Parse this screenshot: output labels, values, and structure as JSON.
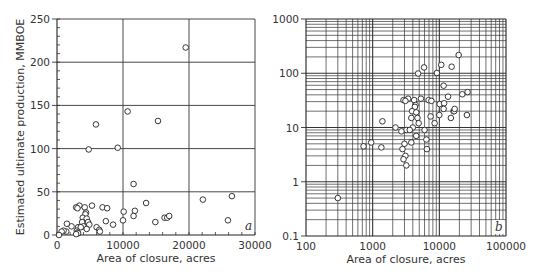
{
  "chart_data": [
    {
      "type": "scatter",
      "panel": "a",
      "xlabel": "Area of closure, acres",
      "ylabel": "Estimated ultimate production, MMBOE",
      "xlim": [
        0,
        30000
      ],
      "ylim": [
        0,
        250
      ],
      "x_ticks": [
        0,
        10000,
        20000,
        30000
      ],
      "y_ticks": [
        0,
        50,
        100,
        150,
        200,
        250
      ],
      "x_tick_labels": [
        "0",
        "10000",
        "20000",
        "30000"
      ],
      "y_tick_labels": [
        "0",
        "50",
        "100",
        "150",
        "200",
        "250"
      ],
      "grid": true,
      "marker": "open-circle",
      "points": [
        [
          19500,
          217
        ],
        [
          10700,
          143
        ],
        [
          15300,
          132
        ],
        [
          5900,
          128
        ],
        [
          4800,
          99
        ],
        [
          9200,
          101
        ],
        [
          11600,
          59
        ],
        [
          22100,
          41
        ],
        [
          26500,
          45
        ],
        [
          25900,
          17
        ],
        [
          13500,
          37
        ],
        [
          10100,
          27
        ],
        [
          10000,
          17
        ],
        [
          11800,
          28
        ],
        [
          11600,
          22
        ],
        [
          14900,
          15
        ],
        [
          16300,
          20
        ],
        [
          16700,
          20
        ],
        [
          17000,
          22
        ],
        [
          7400,
          16
        ],
        [
          8500,
          12
        ],
        [
          6900,
          32
        ],
        [
          7600,
          31
        ],
        [
          5300,
          34
        ],
        [
          3400,
          34
        ],
        [
          2900,
          32
        ],
        [
          3100,
          31
        ],
        [
          4200,
          32
        ],
        [
          4400,
          26
        ],
        [
          4300,
          24
        ],
        [
          3900,
          20
        ],
        [
          4500,
          19
        ],
        [
          3800,
          15
        ],
        [
          4700,
          15
        ],
        [
          4900,
          12
        ],
        [
          4000,
          10
        ],
        [
          3200,
          9
        ],
        [
          3600,
          9
        ],
        [
          4500,
          7
        ],
        [
          6000,
          9
        ],
        [
          6400,
          6
        ],
        [
          6500,
          4
        ],
        [
          3000,
          5
        ],
        [
          3100,
          3
        ],
        [
          3200,
          2
        ],
        [
          2900,
          1
        ],
        [
          2200,
          10
        ],
        [
          1500,
          13
        ],
        [
          1400,
          4
        ],
        [
          1000,
          5
        ],
        [
          700,
          4
        ],
        [
          300,
          0
        ]
      ]
    },
    {
      "type": "scatter",
      "panel": "b",
      "xlabel": "Area of closure, acres",
      "ylabel": "",
      "xscale": "log",
      "yscale": "log",
      "xlim": [
        100,
        100000
      ],
      "ylim": [
        0.1,
        1000
      ],
      "x_ticks": [
        100,
        1000,
        10000,
        100000
      ],
      "y_ticks": [
        0.1,
        1,
        10,
        100,
        1000
      ],
      "x_tick_labels": [
        "100",
        "1000",
        "10000",
        "100000"
      ],
      "y_tick_labels": [
        "0.1",
        "1",
        "10",
        "100",
        "1000"
      ],
      "grid": true,
      "marker": "open-circle",
      "points": [
        [
          19500,
          217
        ],
        [
          10700,
          143
        ],
        [
          15300,
          132
        ],
        [
          5900,
          128
        ],
        [
          4800,
          99
        ],
        [
          9200,
          101
        ],
        [
          11600,
          59
        ],
        [
          22100,
          41
        ],
        [
          26500,
          45
        ],
        [
          25900,
          17
        ],
        [
          13500,
          37
        ],
        [
          10100,
          27
        ],
        [
          10000,
          17
        ],
        [
          11800,
          28
        ],
        [
          11600,
          22
        ],
        [
          14900,
          15
        ],
        [
          16300,
          20
        ],
        [
          16700,
          20
        ],
        [
          17000,
          22
        ],
        [
          7400,
          16
        ],
        [
          8500,
          12
        ],
        [
          6900,
          32
        ],
        [
          7600,
          31
        ],
        [
          5300,
          34
        ],
        [
          3400,
          34
        ],
        [
          2900,
          32
        ],
        [
          3100,
          31
        ],
        [
          4200,
          32
        ],
        [
          4400,
          26
        ],
        [
          4300,
          24
        ],
        [
          3900,
          20
        ],
        [
          4500,
          19
        ],
        [
          3800,
          15
        ],
        [
          4700,
          15
        ],
        [
          4900,
          12
        ],
        [
          4000,
          10
        ],
        [
          3200,
          9
        ],
        [
          3600,
          9
        ],
        [
          4500,
          7
        ],
        [
          6000,
          9
        ],
        [
          6400,
          6
        ],
        [
          6500,
          4
        ],
        [
          3000,
          5
        ],
        [
          3100,
          3
        ],
        [
          3200,
          2
        ],
        [
          2900,
          2.6
        ],
        [
          2200,
          10
        ],
        [
          1400,
          13
        ],
        [
          1350,
          4.3
        ],
        [
          950,
          5.3
        ],
        [
          730,
          4.5
        ],
        [
          300,
          0.5
        ],
        [
          2700,
          8.5
        ],
        [
          3800,
          5.3
        ],
        [
          2800,
          4
        ]
      ]
    }
  ],
  "labels": {
    "a_letter": "a",
    "b_letter": "b"
  }
}
